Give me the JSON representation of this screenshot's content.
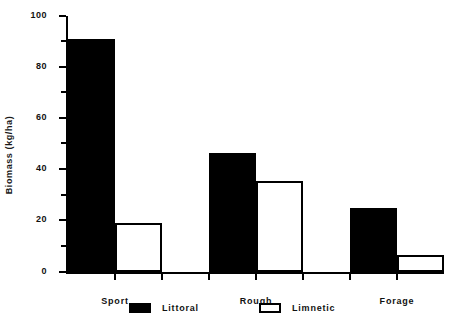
{
  "chart_data": {
    "type": "bar",
    "title": "",
    "subtitle": "",
    "xlabel": "",
    "ylabel": "Biomass (kg/ha)",
    "categories": [
      "Sport",
      "Rough",
      "Forage"
    ],
    "series": [
      {
        "name": "Littoral",
        "values": [
          91,
          46.5,
          25
        ],
        "color": "#000000",
        "fill": "solid"
      },
      {
        "name": "Limnetic",
        "values": [
          19,
          35.5,
          6.5
        ],
        "color": "#ffffff",
        "fill": "outline"
      }
    ],
    "ylim": [
      0,
      100
    ],
    "ytick_major": [
      0,
      20,
      40,
      60,
      80,
      100
    ],
    "ytick_minor": [
      10,
      30,
      50,
      70,
      90
    ],
    "ytick_labels": [
      "0",
      "20",
      "40",
      "60",
      "80",
      "100"
    ],
    "grid": false,
    "legend_position": "bottom",
    "legend_entries": [
      "Littoral",
      "Limnetic"
    ]
  },
  "axis": {
    "y_title": "Biomass (kg/ha)",
    "labels": {
      "t0": "0",
      "t20": "20",
      "t40": "40",
      "t60": "60",
      "t80": "80",
      "t100": "100"
    },
    "categories": {
      "c0": "Sport",
      "c1": "Rough",
      "c2": "Forage"
    }
  },
  "legend": {
    "littoral": "Littoral",
    "limnetic": "Limnetic"
  }
}
